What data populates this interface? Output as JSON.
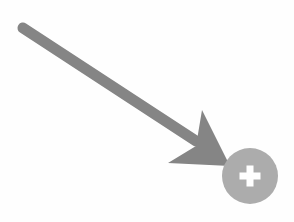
{
  "graphic": {
    "title": "Annotation arrow pointing to add button",
    "background_color": "#fefefe",
    "width": 294,
    "height": 222
  },
  "annotation_arrow": {
    "name": "pointer arrow",
    "color": "#858585",
    "direction": "down-right",
    "shaft": {
      "start_x": 23,
      "start_y": 28,
      "end_x": 196,
      "end_y": 141,
      "thickness": 11,
      "cap": "round"
    },
    "arrowhead": {
      "tip_x": 230,
      "tip_y": 166,
      "upper_barb_x": 202,
      "upper_barb_y": 110,
      "lower_barb_x": 168,
      "lower_barb_y": 163,
      "notch_x": 196,
      "notch_y": 146
    }
  },
  "add_button": {
    "label": "Add",
    "icon": "plus-icon",
    "icon_symbol": "+",
    "circle_color": "#acacac",
    "icon_color": "#ffffff",
    "center_x": 250,
    "center_y": 176,
    "radius": 28,
    "plus_arm_length": 21,
    "plus_stroke": 7
  }
}
